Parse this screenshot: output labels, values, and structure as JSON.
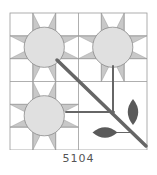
{
  "pattern": {
    "label": "5104",
    "grid": {
      "x": 10,
      "y": 13,
      "size": 137,
      "quadrants": 2,
      "cells_per_quadrant": 3
    },
    "colors": {
      "background": "#ffffff",
      "grid_line": "#9a9a9a",
      "star_point": "#c8c8c8",
      "flower_center": "#e0e0e0",
      "flower_outline": "#8a8a8a",
      "stem": "#666666",
      "leaf": "#5a5a5a"
    },
    "star_blocks": [
      {
        "name": "star-block-top-left",
        "col": 0,
        "row": 0
      },
      {
        "name": "star-block-top-right",
        "col": 1,
        "row": 0
      },
      {
        "name": "star-block-bottom-left",
        "col": 0,
        "row": 1
      }
    ],
    "plain_block": {
      "name": "leaf-block-bottom-right",
      "col": 1,
      "row": 1
    },
    "stems": [
      {
        "name": "diagonal-stem",
        "x1": 57,
        "y1": 60,
        "x2": 146,
        "y2": 146,
        "width": 3.5
      },
      {
        "name": "vertical-stem",
        "x1": 113,
        "y1": 66,
        "x2": 113,
        "y2": 113,
        "width": 2
      },
      {
        "name": "horizontal-stem",
        "x1": 66,
        "y1": 112,
        "x2": 114,
        "y2": 112,
        "width": 2
      },
      {
        "name": "leaf-stem-horizontal",
        "x1": 116,
        "y1": 132.5,
        "x2": 130,
        "y2": 132.5,
        "width": 1
      }
    ],
    "leaves": [
      {
        "name": "leaf-vertical",
        "cx": 133,
        "cy": 112,
        "length": 26,
        "width": 11,
        "angle": 0
      },
      {
        "name": "leaf-horizontal",
        "cx": 105,
        "cy": 132.5,
        "length": 25,
        "width": 11,
        "angle": 90
      }
    ]
  }
}
